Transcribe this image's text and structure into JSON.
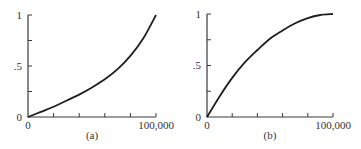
{
  "chart_data": [
    {
      "type": "line",
      "title": "(a)",
      "caption": "(a)",
      "xlabel": "",
      "ylabel": "",
      "xlim": [
        0,
        100000
      ],
      "ylim": [
        0,
        1
      ],
      "x_tick_labels": [
        "0",
        "100,000"
      ],
      "y_tick_labels": [
        "0",
        ".5",
        "1"
      ],
      "x_ticks": [
        0,
        20000,
        40000,
        60000,
        80000,
        100000
      ],
      "y_ticks": [
        0,
        0.25,
        0.5,
        0.75,
        1
      ],
      "grid": false,
      "legend": null,
      "series": [
        {
          "name": "curve-a (convex)",
          "x": [
            0,
            10000,
            20000,
            30000,
            40000,
            50000,
            60000,
            70000,
            80000,
            90000,
            100000
          ],
          "values": [
            0,
            0.05,
            0.1,
            0.16,
            0.22,
            0.29,
            0.37,
            0.47,
            0.6,
            0.77,
            1.0
          ]
        }
      ]
    },
    {
      "type": "line",
      "title": "(b)",
      "caption": "(b)",
      "xlabel": "",
      "ylabel": "",
      "xlim": [
        0,
        100000
      ],
      "ylim": [
        0,
        1
      ],
      "x_tick_labels": [
        "0",
        "100,000"
      ],
      "y_tick_labels": [
        "0",
        ".5",
        "1"
      ],
      "x_ticks": [
        0,
        20000,
        40000,
        60000,
        80000,
        100000
      ],
      "y_ticks": [
        0,
        0.25,
        0.5,
        0.75,
        1
      ],
      "grid": false,
      "legend": null,
      "series": [
        {
          "name": "curve-b (concave)",
          "x": [
            0,
            10000,
            20000,
            30000,
            40000,
            50000,
            60000,
            70000,
            80000,
            90000,
            100000
          ],
          "values": [
            0,
            0.2,
            0.38,
            0.53,
            0.65,
            0.76,
            0.84,
            0.91,
            0.96,
            0.99,
            1.0
          ]
        }
      ]
    }
  ],
  "panels": {
    "a": {
      "caption": "(a)",
      "y_top": "1",
      "y_mid": ".5",
      "y_zero": "0",
      "x_zero": "0",
      "x_max": "100,000"
    },
    "b": {
      "caption": "(b)",
      "y_top": "1",
      "y_mid": ".5",
      "y_zero": "0",
      "x_zero": "0",
      "x_max": "100,000"
    }
  }
}
